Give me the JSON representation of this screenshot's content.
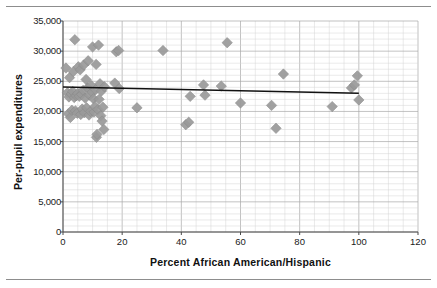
{
  "figure": {
    "top_rule": "",
    "bottom_rule": ""
  },
  "axes": {
    "x": {
      "title": "Percent African American/Hispanic",
      "ticks": [
        0,
        20,
        40,
        60,
        80,
        100,
        120
      ],
      "tick_labels": [
        "0",
        "20",
        "40",
        "60",
        "80",
        "100",
        "120"
      ],
      "min": 0,
      "max": 120,
      "major_step": 20,
      "minor_step": 5
    },
    "y": {
      "title": "Per-pupil expenditures",
      "ticks": [
        0,
        5000,
        10000,
        15000,
        20000,
        25000,
        30000,
        35000
      ],
      "tick_labels": [
        "0",
        "5,000",
        "10,000",
        "15,000",
        "20,000",
        "25,000",
        "30,000",
        "35,000"
      ],
      "min": 0,
      "max": 35000,
      "major_step": 5000,
      "minor_step": 1000
    }
  },
  "colors": {
    "marker": "#9a9a9a",
    "marker_stroke": "#8a8a8a",
    "trendline": "#111111",
    "grid_minor": "#d4d4d4",
    "grid_major": "#a8a8a8",
    "axis": "#4a4a4a",
    "text": "#1a1a1a",
    "background": "#ffffff"
  },
  "chart_data": {
    "type": "scatter",
    "title": "",
    "xlabel": "Percent African American/Hispanic",
    "ylabel": "Per-pupil expenditures",
    "xlim": [
      0,
      120
    ],
    "ylim": [
      0,
      35000
    ],
    "xticks": [
      0,
      20,
      40,
      60,
      80,
      100,
      120
    ],
    "yticks": [
      0,
      5000,
      10000,
      15000,
      20000,
      25000,
      30000,
      35000
    ],
    "grid": true,
    "legend": false,
    "marker_shape": "diamond",
    "marker_color": "#9a9a9a",
    "series": [
      {
        "name": "Districts",
        "points": [
          [
            1.0,
            27200
          ],
          [
            1.5,
            23100
          ],
          [
            1.8,
            19600
          ],
          [
            2.0,
            22400
          ],
          [
            2.2,
            25600
          ],
          [
            2.5,
            19000
          ],
          [
            2.8,
            22900
          ],
          [
            3.0,
            20200
          ],
          [
            3.3,
            23300
          ],
          [
            3.5,
            26600
          ],
          [
            3.8,
            22300
          ],
          [
            4.0,
            31900
          ],
          [
            4.2,
            20100
          ],
          [
            4.5,
            22600
          ],
          [
            4.8,
            19700
          ],
          [
            5.0,
            23000
          ],
          [
            5.2,
            27400
          ],
          [
            5.5,
            22500
          ],
          [
            5.8,
            26900
          ],
          [
            6.0,
            19500
          ],
          [
            6.3,
            22800
          ],
          [
            6.5,
            20400
          ],
          [
            6.8,
            23500
          ],
          [
            7.0,
            27700
          ],
          [
            7.2,
            19800
          ],
          [
            7.5,
            22200
          ],
          [
            7.8,
            25300
          ],
          [
            8.0,
            20600
          ],
          [
            8.3,
            23900
          ],
          [
            8.5,
            28400
          ],
          [
            8.8,
            19400
          ],
          [
            9.0,
            22700
          ],
          [
            9.3,
            20000
          ],
          [
            9.5,
            24300
          ],
          [
            9.8,
            23200
          ],
          [
            10.0,
            30700
          ],
          [
            10.3,
            22100
          ],
          [
            10.5,
            19900
          ],
          [
            10.8,
            20800
          ],
          [
            11.0,
            23600
          ],
          [
            11.2,
            27800
          ],
          [
            11.3,
            15700
          ],
          [
            11.5,
            16200
          ],
          [
            11.8,
            20300
          ],
          [
            12.0,
            31000
          ],
          [
            12.2,
            22000
          ],
          [
            12.5,
            24600
          ],
          [
            12.8,
            19300
          ],
          [
            13.0,
            23400
          ],
          [
            13.2,
            18400
          ],
          [
            13.5,
            20700
          ],
          [
            13.8,
            17000
          ],
          [
            14.0,
            24100
          ],
          [
            17.5,
            24700
          ],
          [
            18.0,
            29900
          ],
          [
            18.8,
            30100
          ],
          [
            19.0,
            23800
          ],
          [
            25.0,
            20600
          ],
          [
            33.8,
            30100
          ],
          [
            41.5,
            17800
          ],
          [
            42.5,
            18200
          ],
          [
            43.0,
            22500
          ],
          [
            47.5,
            24400
          ],
          [
            48.0,
            22700
          ],
          [
            53.5,
            24200
          ],
          [
            55.5,
            31400
          ],
          [
            60.0,
            21400
          ],
          [
            70.5,
            21000
          ],
          [
            72.0,
            17200
          ],
          [
            74.5,
            26200
          ],
          [
            91.0,
            20800
          ],
          [
            97.5,
            23900
          ],
          [
            98.5,
            24400
          ],
          [
            99.5,
            25900
          ],
          [
            100.0,
            21900
          ]
        ]
      }
    ],
    "trendline": {
      "type": "linear",
      "x_start": 0,
      "y_start": 24050,
      "x_end": 100,
      "y_end": 23000,
      "color": "#111111"
    },
    "n_points": 75
  }
}
